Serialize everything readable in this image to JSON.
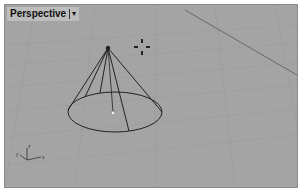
{
  "viewport": {
    "title": "Perspective",
    "menu_caret": "▾",
    "background_color": "#a4a4a4",
    "grid_line_color": "#999999",
    "object": "cone",
    "wire_color": "#222222",
    "gumball_icon": "gumball-icon",
    "axis_labels": {
      "x": "x",
      "y": "y",
      "z": "z"
    }
  }
}
